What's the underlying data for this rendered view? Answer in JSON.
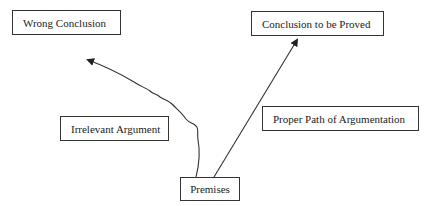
{
  "diagram": {
    "nodes": [
      {
        "id": "wrong-conclusion",
        "label": "Wrong Conclusion"
      },
      {
        "id": "conclusion-to-be-proved",
        "label": "Conclusion to be Proved"
      },
      {
        "id": "irrelevant-argument",
        "label": "Irrelevant Argument"
      },
      {
        "id": "proper-path",
        "label": "Proper Path of Argumentation"
      },
      {
        "id": "premises",
        "label": "Premises"
      }
    ],
    "edges": [
      {
        "from": "premises",
        "to": "conclusion-to-be-proved",
        "style": "straight-arrow"
      },
      {
        "from": "premises",
        "to": "wrong-conclusion",
        "style": "wavy-arrow"
      }
    ],
    "colors": {
      "stroke": "#333333",
      "text": "#222222",
      "background": "#ffffff"
    }
  }
}
